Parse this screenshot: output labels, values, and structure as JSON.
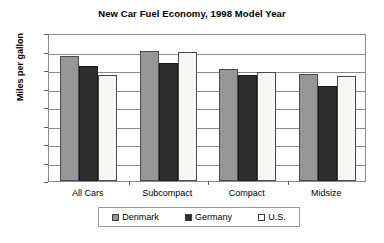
{
  "chart_data": {
    "type": "bar",
    "title": "New Car Fuel Economy, 1998 Model Year",
    "xlabel": "",
    "ylabel": "Miles per gallon",
    "categories": [
      "All Cars",
      "Subcompact",
      "Compact",
      "Midsize"
    ],
    "series": [
      {
        "name": "Denmark",
        "color": "#969696",
        "values": [
          33.8,
          35.2,
          30.3,
          28.9
        ]
      },
      {
        "name": "Germany",
        "color": "#2e2e2e",
        "values": [
          31.2,
          32.0,
          28.6,
          25.6
        ]
      },
      {
        "name": "U.S.",
        "color": "#ffffff",
        "values": [
          28.6,
          34.9,
          29.4,
          28.3
        ]
      }
    ],
    "ylim": [
      0,
      40
    ],
    "yticks": [
      0,
      5,
      10,
      15,
      20,
      25,
      30,
      35,
      40
    ],
    "ytick_labels": [
      "0",
      "5",
      "10",
      "15",
      "20",
      "25",
      "30",
      "35",
      "40"
    ],
    "grid": true,
    "grid_axis": "y",
    "legend_position": "bottom",
    "legend_entries": [
      "Denmark",
      "Germany",
      "U.S."
    ]
  }
}
